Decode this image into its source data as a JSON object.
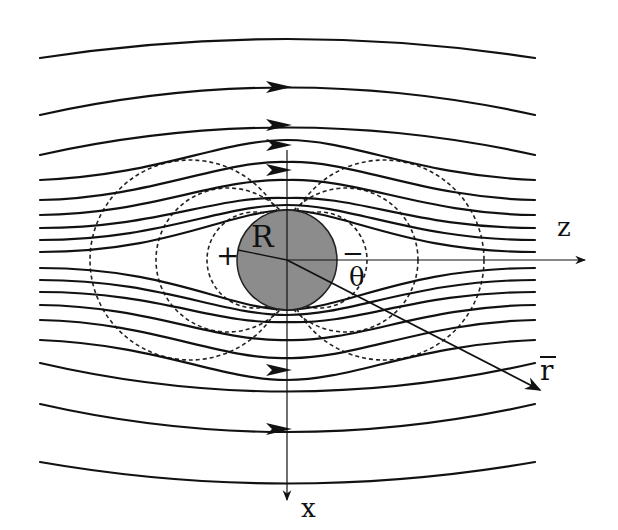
{
  "figure": {
    "labels": {
      "sphere_radius": "R",
      "z_axis": "z",
      "x_axis": "x",
      "position_vector": "r",
      "angle": "θ",
      "positive_pole": "+",
      "negative_pole": "−"
    },
    "colors": {
      "sphere_fill": "#8c8c8c",
      "line_color": "#111111",
      "background": "#ffffff"
    },
    "sphere": {
      "cx": 287,
      "cy": 260,
      "r": 50
    },
    "axes": {
      "z": {
        "x1": 240,
        "y1": 260,
        "x2": 585,
        "y2": 260
      },
      "x": {
        "x1": 287,
        "y1": 150,
        "x2": 287,
        "y2": 500
      },
      "r_vector": {
        "x1": 287,
        "y1": 260,
        "x2": 540,
        "y2": 390
      }
    }
  }
}
